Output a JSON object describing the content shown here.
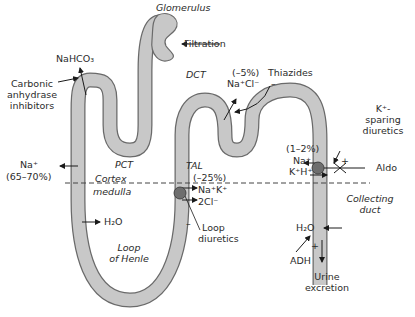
{
  "regions": {
    "glomerulus": "Glomerulus",
    "pct": "PCT",
    "dct": "DCT",
    "tal": "TAL",
    "cortex": "Cortex",
    "medulla": "medulla",
    "loop_line1": "Loop",
    "loop_line2": "of Henle",
    "collecting_line1": "Collecting",
    "collecting_line2": "duct"
  },
  "labels": {
    "filtration": "Filtration",
    "nahco3": "NaHCO₃",
    "carbonic_line1": "Carbonic",
    "carbonic_line2": "anhydrase",
    "carbonic_line3": "inhibitors",
    "pct_na": "Na⁺",
    "pct_pct": "(65–70%)",
    "pct_h2o": "H₂O",
    "dct_pct": "(–5%)",
    "dct_ion": "Na⁺Cl⁻",
    "thiazides": "Thiazides",
    "thiazides_sign": "–",
    "tal_pct": "(–25%)",
    "tal_ion1": "Na⁺K⁺",
    "tal_ion2": "2Cl⁻",
    "loop_sign": "–",
    "loop_diuretics_1": "Loop",
    "loop_diuretics_2": "diuretics",
    "cd_pct": "(1–2%)",
    "cd_na": "Na⁺",
    "cd_kh": "K⁺H⁺",
    "cd_plus": "+",
    "k_sparing_1": "K⁺-",
    "k_sparing_2": "sparing",
    "k_sparing_3": "diuretics",
    "aldo": "Aldo",
    "cd_h2o": "H₂O",
    "adh": "ADH",
    "adh_plus": "+",
    "urine_1": "Urine",
    "urine_2": "excretion"
  },
  "colors": {
    "tubule_fill": "#c8c8c8",
    "tubule_stroke": "#6a6a6a",
    "transporter": "#6e6e6e",
    "arrow": "#1a1a1a"
  }
}
